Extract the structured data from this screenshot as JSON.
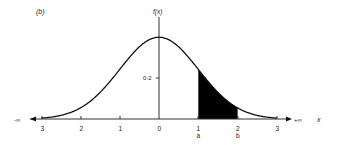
{
  "panel_label": "(b)",
  "chart_data": {
    "type": "line",
    "title": "(b)",
    "xlabel": "x",
    "ylabel": "f(x)",
    "curve": "standard normal density",
    "x": [
      -3,
      -2.5,
      -2,
      -1.5,
      -1,
      -0.5,
      0,
      0.5,
      1,
      1.5,
      2,
      2.5,
      3
    ],
    "values": [
      0.004,
      0.018,
      0.054,
      0.13,
      0.242,
      0.352,
      0.399,
      0.352,
      0.242,
      0.13,
      0.054,
      0.018,
      0.004
    ],
    "xticks": [
      "3",
      "2",
      "1",
      "0",
      "1",
      "2",
      "3"
    ],
    "xtick_values": [
      -3,
      -2,
      -1,
      0,
      1,
      2,
      3
    ],
    "yticks": [
      "0·2"
    ],
    "ytick_values": [
      0.2
    ],
    "x_left_label": "-∞",
    "x_right_label": "+∞",
    "shaded_region": {
      "from": 1,
      "to": 2,
      "from_label": "a",
      "to_label": "b",
      "color": "#000000"
    },
    "xlim": [
      -3,
      3
    ],
    "ylim": [
      0,
      0.4
    ],
    "grid": false,
    "legend": null
  },
  "colors": {
    "line": "#111111",
    "fill": "#000000",
    "background": "#ffffff"
  }
}
